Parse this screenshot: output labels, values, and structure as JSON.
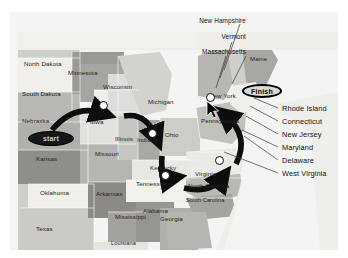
{
  "map": {
    "title": "United States route map",
    "background_color": "#f2f2f2",
    "land_colors": {
      "light": "#f0efec",
      "mid_light": "#d6d5d1",
      "mid": "#b9b8b4",
      "dark": "#9a9996",
      "darker": "#828180",
      "water": "#e9e9e6"
    },
    "route_color": "#0d0d0d",
    "marker_fill": "#ffffff",
    "marker_stroke": "#0d0d0d"
  },
  "badges": {
    "start": {
      "label": "start",
      "bg": "#15181a",
      "text_color": "#c9cccd"
    },
    "finish": {
      "label": "Finish",
      "bg": "#d8d8d4",
      "text_color": "#0a0a0a"
    }
  },
  "state_labels": [
    {
      "name": "North Dakota",
      "x": 24,
      "y": 60
    },
    {
      "name": "South Dakota",
      "x": 22,
      "y": 90
    },
    {
      "name": "Nebraska",
      "x": 22,
      "y": 117
    },
    {
      "name": "Kansas",
      "x": 36,
      "y": 155
    },
    {
      "name": "Oklahoma",
      "x": 40,
      "y": 189
    },
    {
      "name": "Texas",
      "x": 36,
      "y": 225
    },
    {
      "name": "Minnesota",
      "x": 68,
      "y": 69
    },
    {
      "name": "Iowa",
      "x": 90,
      "y": 118
    },
    {
      "name": "Missouri",
      "x": 95,
      "y": 150
    },
    {
      "name": "Arkansas",
      "x": 96,
      "y": 190
    },
    {
      "name": "Mississippi",
      "x": 115,
      "y": 213
    },
    {
      "name": "Louisiana",
      "x": 111,
      "y": 240
    },
    {
      "name": "Wisconsin",
      "x": 103,
      "y": 83
    },
    {
      "name": "Illinois",
      "x": 115,
      "y": 135
    },
    {
      "name": "Indiana",
      "x": 137,
      "y": 136
    },
    {
      "name": "Michigan",
      "x": 148,
      "y": 98
    },
    {
      "name": "Ohio",
      "x": 165,
      "y": 131
    },
    {
      "name": "Kentucky",
      "x": 150,
      "y": 164
    },
    {
      "name": "Tennessee",
      "x": 136,
      "y": 180
    },
    {
      "name": "Alabama",
      "x": 143,
      "y": 207
    },
    {
      "name": "Georgia",
      "x": 160,
      "y": 215
    },
    {
      "name": "Virginia",
      "x": 195,
      "y": 170
    },
    {
      "name": "North Carolina",
      "x": 188,
      "y": 182
    },
    {
      "name": "South Carolina",
      "x": 184,
      "y": 197
    },
    {
      "name": "Pennsylvania",
      "x": 201,
      "y": 117
    },
    {
      "name": "New York",
      "x": 209,
      "y": 92
    },
    {
      "name": "Maine",
      "x": 250,
      "y": 55
    }
  ],
  "new_england_labels": [
    {
      "name": "New Hampshire",
      "x": 176,
      "y": 17
    },
    {
      "name": "Vermont",
      "x": 200,
      "y": 33
    },
    {
      "name": "Massachusetts",
      "x": 176,
      "y": 48
    }
  ],
  "callout_labels": [
    {
      "name": "Rhode Island",
      "x": 283,
      "y": 106
    },
    {
      "name": "Connecticut",
      "x": 283,
      "y": 119
    },
    {
      "name": "New Jersey",
      "x": 283,
      "y": 132
    },
    {
      "name": "Maryland",
      "x": 283,
      "y": 145
    },
    {
      "name": "Delaware",
      "x": 283,
      "y": 158
    },
    {
      "name": "West Virginia",
      "x": 283,
      "y": 171
    }
  ],
  "route": {
    "stops": [
      {
        "label": "Iowa stop",
        "x": 103,
        "y": 105
      },
      {
        "label": "Indiana stop",
        "x": 152,
        "y": 133
      },
      {
        "label": "Tennessee stop",
        "x": 165,
        "y": 175
      },
      {
        "label": "Virginia stop",
        "x": 219,
        "y": 160
      },
      {
        "label": "New York stop",
        "x": 210,
        "y": 97
      }
    ],
    "order": "start → Iowa → Indiana → Tennessee → Virginia → New York → Finish"
  },
  "cursor": {
    "x": 206,
    "y": 104,
    "kind": "arrow-pointer"
  }
}
